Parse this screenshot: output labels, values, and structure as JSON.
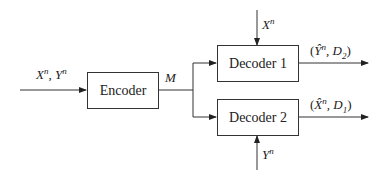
{
  "diagram": {
    "type": "block-diagram",
    "blocks": [
      {
        "id": "encoder",
        "label": "Encoder"
      },
      {
        "id": "decoder1",
        "label": "Decoder 1"
      },
      {
        "id": "decoder2",
        "label": "Decoder 2"
      }
    ],
    "edges": [
      {
        "from": "input",
        "to": "encoder",
        "label": "Xⁿ, Yⁿ"
      },
      {
        "from": "encoder",
        "to": "decoder1",
        "label": "M"
      },
      {
        "from": "encoder",
        "to": "decoder2",
        "label": "M"
      },
      {
        "from": "side1",
        "to": "decoder1",
        "label": "Xⁿ"
      },
      {
        "from": "side2",
        "to": "decoder2",
        "label": "Yⁿ"
      },
      {
        "from": "decoder1",
        "to": "output1",
        "label": "(Ŷⁿ, D₂)"
      },
      {
        "from": "decoder2",
        "to": "output2",
        "label": "(X̂ⁿ, D₁)"
      }
    ]
  },
  "labels": {
    "encoder": "Encoder",
    "decoder1": "Decoder 1",
    "decoder2": "Decoder 2",
    "input_main": "X",
    "input_sep": ", ",
    "input_second": "Y",
    "sup_n": "n",
    "message": "M",
    "side1": "X",
    "side2": "Y",
    "out1_open": "(",
    "out1_var": "Ŷ",
    "out1_mid": ", D",
    "out1_sub": "2",
    "out1_close": ")",
    "out2_open": "(",
    "out2_var": "X̂",
    "out2_mid": ", D",
    "out2_sub": "1",
    "out2_close": ")"
  }
}
